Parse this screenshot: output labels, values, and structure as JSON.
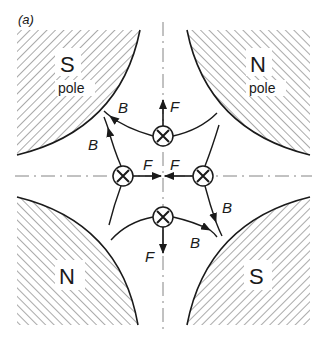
{
  "figure": {
    "panel_label": "(a)",
    "poles": [
      {
        "id": "top-left",
        "letter": "S",
        "sub": "pole"
      },
      {
        "id": "top-right",
        "letter": "N",
        "sub": "pole"
      },
      {
        "id": "bottom-left",
        "letter": "N",
        "sub": ""
      },
      {
        "id": "bottom-right",
        "letter": "S",
        "sub": ""
      }
    ],
    "conductors": [
      {
        "id": "top",
        "symbol": "⊗",
        "force_label": "F",
        "force_dir": "up"
      },
      {
        "id": "left",
        "symbol": "⊗",
        "force_label": "F",
        "force_dir": "right"
      },
      {
        "id": "right",
        "symbol": "⊗",
        "force_label": "F",
        "force_dir": "left"
      },
      {
        "id": "bottom",
        "symbol": "⊗",
        "force_label": "F",
        "force_dir": "down"
      }
    ],
    "field_labels": [
      "B",
      "B",
      "B",
      "B"
    ],
    "colors": {
      "ink": "#1a1a1a",
      "hatch": "#555555",
      "background": "#ffffff"
    }
  }
}
